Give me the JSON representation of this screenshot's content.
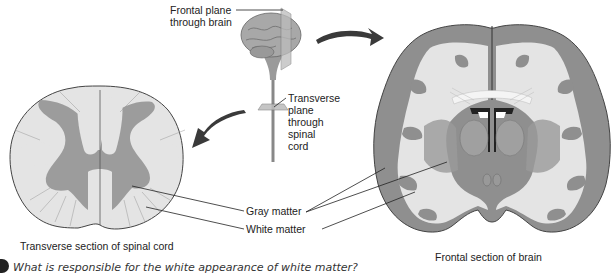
{
  "figure": {
    "labels": {
      "frontal_plane": "Frontal plane\nthrough brain",
      "transverse_plane": "Transverse\nplane\nthrough\nspinal\ncord",
      "gray_matter": "Gray matter",
      "white_matter": "White matter",
      "spinal_caption": "Transverse section of spinal cord",
      "brain_caption": "Frontal section of brain"
    },
    "question": "What is responsible for the white appearance of white matter?",
    "colors": {
      "gray_matter": "#8f8f8f",
      "white_matter": "#e4e4e4",
      "outline": "#444444",
      "arrow": "#3a3a3a"
    }
  }
}
